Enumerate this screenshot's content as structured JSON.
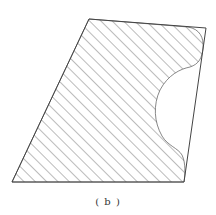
{
  "figure": {
    "caption": "( b )",
    "stroke_color": "#444444",
    "hatch_color": "#555555",
    "outline": [
      [
        89,
        19
      ],
      [
        206,
        28
      ],
      [
        184,
        182
      ],
      [
        12,
        182
      ]
    ],
    "hatched_region_description": "Quadrilateral with a concave circular cut on the right side and rounded corners at top-right and bottom-right, filled with diagonal hatching"
  }
}
